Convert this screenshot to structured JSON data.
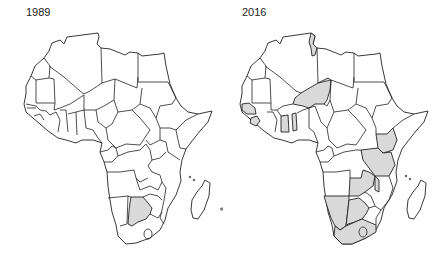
{
  "maps": [
    {
      "title": "1989",
      "highlight_color": "#d9d9d9",
      "highlighted_countries": [
        "Botswana"
      ]
    },
    {
      "title": "2016",
      "highlight_color": "#d9d9d9",
      "highlighted_countries": [
        "Tunisia",
        "Niger",
        "Senegal",
        "Gambia",
        "Sierra Leone",
        "Ghana",
        "Benin",
        "Kenya",
        "Tanzania",
        "Zambia",
        "Malawi",
        "Namibia",
        "Botswana",
        "South Africa"
      ]
    }
  ],
  "colors": {
    "outline": "#222222",
    "land": "#ffffff",
    "highlight": "#d9d9d9"
  }
}
